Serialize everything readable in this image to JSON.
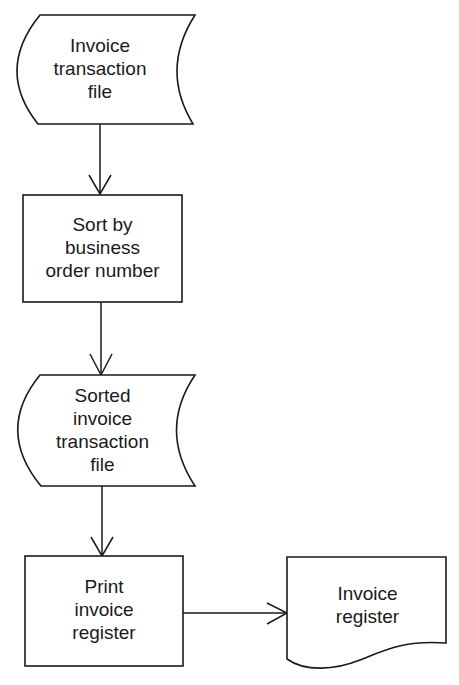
{
  "diagram": {
    "type": "flowchart",
    "nodes": [
      {
        "id": "n1",
        "shape": "stored-data",
        "lines": [
          "Invoice",
          "transaction",
          "file"
        ]
      },
      {
        "id": "n2",
        "shape": "process",
        "lines": [
          "Sort by",
          "business",
          "order number"
        ]
      },
      {
        "id": "n3",
        "shape": "stored-data",
        "lines": [
          "Sorted",
          "invoice",
          "transaction",
          "file"
        ]
      },
      {
        "id": "n4",
        "shape": "process",
        "lines": [
          "Print",
          "invoice",
          "register"
        ]
      },
      {
        "id": "n5",
        "shape": "document",
        "lines": [
          "Invoice",
          "register"
        ]
      }
    ],
    "edges": [
      {
        "from": "n1",
        "to": "n2"
      },
      {
        "from": "n2",
        "to": "n3"
      },
      {
        "from": "n3",
        "to": "n4"
      },
      {
        "from": "n4",
        "to": "n5"
      }
    ],
    "colors": {
      "stroke": "#1a1a1a",
      "background": "#ffffff"
    }
  }
}
